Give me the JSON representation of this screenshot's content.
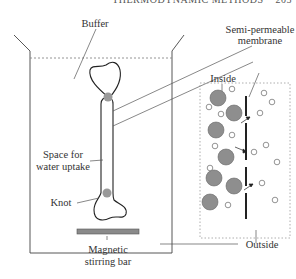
{
  "header": {
    "running_title": "THERMODYNAMIC METHODS",
    "page_number": "205"
  },
  "labels": {
    "buffer": "Buffer",
    "semi_permeable_line1": "Semi-permeable",
    "semi_permeable_line2": "membrane",
    "inside": "Inside",
    "space_line1": "Space for",
    "space_line2": "water uptake",
    "knot": "Knot",
    "outside": "Outside",
    "stir_line1": "Magnetic",
    "stir_line2": "stirring bar"
  },
  "colors": {
    "line": "#444444",
    "knot_fill": "#9a9a9a",
    "large_molecule_fill": "#8e8e8e",
    "stir_bar_fill": "#8a8a8a",
    "dotted": "#888888"
  },
  "inset": {
    "large_molecules_inside": 8,
    "small_molecules_total": 18,
    "membrane_pores_with_arrows": 3
  }
}
